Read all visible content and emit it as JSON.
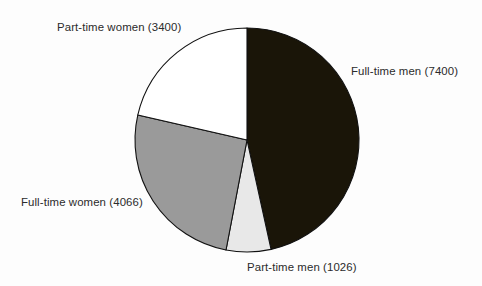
{
  "chart_data": {
    "type": "pie",
    "title": "",
    "subtitle": "",
    "xlabel": "",
    "ylabel": "",
    "legend_position": "none",
    "grid": false,
    "total": 15892,
    "start_angle_deg": 0,
    "direction": "clockwise",
    "categories": [
      "Full-time men",
      "Part-time men",
      "Full-time women",
      "Part-time women"
    ],
    "values": [
      7400,
      1026,
      4066,
      3400
    ],
    "slices": [
      {
        "name": "full-time-men",
        "label": "Full-time men (7400)",
        "category": "Full-time men",
        "value": 7400,
        "percent": 46.6,
        "angle_deg": 167.6,
        "start_deg": 0,
        "end_deg": 167.6,
        "color": "#1a1508"
      },
      {
        "name": "part-time-men",
        "label": "Part-time men (1026)",
        "category": "Part-time men",
        "value": 1026,
        "percent": 6.5,
        "angle_deg": 23.2,
        "start_deg": 167.6,
        "end_deg": 190.8,
        "color": "#e8e8e8"
      },
      {
        "name": "full-time-women",
        "label": "Full-time women (4066)",
        "category": "Full-time women",
        "value": 4066,
        "percent": 25.6,
        "angle_deg": 92.1,
        "start_deg": 190.8,
        "end_deg": 282.9,
        "color": "#9a9a9a"
      },
      {
        "name": "part-time-women",
        "label": "Part-time women (3400)",
        "category": "Part-time women",
        "value": 3400,
        "percent": 21.4,
        "angle_deg": 77.1,
        "start_deg": 282.9,
        "end_deg": 360,
        "color": "#ffffff"
      }
    ],
    "geometry": {
      "center_x": 247,
      "center_y": 140,
      "radius": 112
    },
    "colors": {
      "background": "#fdfdfd",
      "outline": "#111111",
      "text": "#2b2b2b"
    }
  }
}
